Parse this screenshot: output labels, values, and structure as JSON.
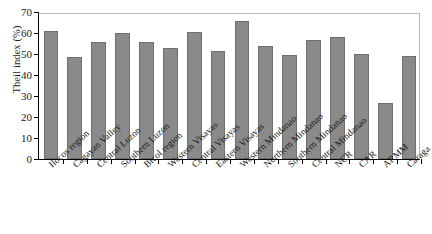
{
  "chart_data": {
    "type": "bar",
    "title": "",
    "xlabel": "",
    "ylabel": "Theil index (%)",
    "ylim": [
      0,
      70
    ],
    "yticks": [
      0,
      10,
      20,
      30,
      40,
      50,
      60,
      70
    ],
    "grid": false,
    "legend": "none",
    "bar_color": "#8a8a8a",
    "bar_edge_color": "#6f6f6f",
    "categories": [
      "Ilocos region",
      "Cagayan Valley",
      "Central Luzon",
      "Southern Luzon",
      "Bicol region",
      "Western Visayas",
      "Central Visayas",
      "Eastern Visayas",
      "Western Mindanao",
      "Northern Mindanao",
      "Southern Mindanao",
      "Central Mindanao",
      "NCR",
      "CAR",
      "ARMM",
      "Caraga"
    ],
    "values": [
      61.0,
      48.5,
      55.8,
      60.2,
      55.5,
      53.0,
      60.5,
      51.5,
      65.5,
      53.8,
      49.7,
      56.8,
      58.2,
      50.2,
      26.8,
      49.0
    ]
  }
}
